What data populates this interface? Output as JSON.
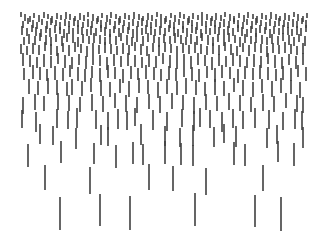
{
  "artwork": {
    "description": "Abstract pattern of vertical dashes, dense and short at top, sparse and long at bottom",
    "stroke_color": "#3f3f3f",
    "stroke_width": 1.6,
    "background": "#ffffff",
    "rows": [
      {
        "y": 14,
        "h": 6,
        "xs": [
          21,
          25,
          30,
          34,
          39,
          44,
          48,
          52,
          57,
          61,
          66,
          70,
          75,
          80,
          84,
          88,
          93,
          98,
          102,
          107,
          111,
          116,
          120,
          125,
          129,
          134,
          139,
          143,
          148,
          152,
          157,
          161,
          166,
          171,
          175,
          180,
          184,
          189,
          193,
          198,
          202,
          207,
          212,
          216,
          221,
          225,
          230,
          234,
          239,
          244,
          248,
          253,
          257,
          262,
          266,
          271,
          276,
          280,
          285,
          289,
          294,
          298,
          303,
          307
        ]
      },
      {
        "y": 20,
        "h": 7,
        "xs": [
          23,
          28,
          33,
          37,
          42,
          47,
          51,
          56,
          60,
          65,
          69,
          74,
          78,
          83,
          88,
          92,
          97,
          101,
          106,
          110,
          115,
          119,
          124,
          129,
          133,
          138,
          142,
          147,
          151,
          156,
          161,
          165,
          170,
          174,
          179,
          183,
          188,
          192,
          197,
          202,
          206,
          211,
          215,
          220,
          224,
          229,
          234,
          238,
          243,
          247,
          252,
          256,
          261,
          266,
          270,
          275,
          279,
          284,
          288,
          293,
          297,
          302,
          306
        ]
      },
      {
        "y": 27,
        "h": 8,
        "xs": [
          22,
          27,
          32,
          36,
          41,
          46,
          50,
          55,
          60,
          64,
          69,
          73,
          78,
          82,
          87,
          91,
          96,
          101,
          105,
          110,
          114,
          119,
          123,
          128,
          133,
          137,
          142,
          146,
          151,
          155,
          160,
          165,
          169,
          174,
          178,
          183,
          187,
          192,
          196,
          201,
          206,
          210,
          215,
          219,
          224,
          228,
          233,
          238,
          242,
          247,
          251,
          256,
          260,
          265,
          270,
          274,
          279,
          283,
          288,
          292,
          297,
          301,
          306
        ]
      },
      {
        "y": 35,
        "h": 9,
        "xs": [
          24,
          29,
          35,
          40,
          46,
          51,
          56,
          62,
          67,
          73,
          78,
          83,
          89,
          94,
          100,
          105,
          110,
          116,
          121,
          127,
          132,
          137,
          143,
          148,
          154,
          159,
          164,
          170,
          175,
          181,
          186,
          191,
          197,
          202,
          208,
          213,
          218,
          224,
          229,
          235,
          240,
          245,
          251,
          256,
          262,
          267,
          272,
          278,
          283,
          289,
          294,
          299,
          305
        ]
      },
      {
        "y": 44,
        "h": 10,
        "xs": [
          21,
          27,
          33,
          39,
          45,
          51,
          57,
          63,
          69,
          75,
          81,
          87,
          93,
          99,
          105,
          111,
          117,
          123,
          129,
          135,
          141,
          147,
          153,
          159,
          165,
          171,
          177,
          183,
          189,
          195,
          201,
          207,
          213,
          219,
          225,
          231,
          237,
          243,
          249,
          255,
          261,
          267,
          273,
          279,
          285,
          291,
          297,
          303
        ]
      },
      {
        "y": 55,
        "h": 12,
        "xs": [
          23,
          30,
          37,
          44,
          51,
          58,
          65,
          72,
          79,
          86,
          93,
          100,
          107,
          114,
          121,
          128,
          135,
          142,
          149,
          156,
          163,
          170,
          177,
          184,
          191,
          198,
          205,
          212,
          219,
          226,
          233,
          240,
          247,
          254,
          261,
          268,
          275,
          282,
          289,
          296,
          303
        ]
      },
      {
        "y": 67,
        "h": 13,
        "xs": [
          24,
          33,
          40,
          47,
          55,
          63,
          70,
          78,
          85,
          92,
          100,
          108,
          115,
          123,
          131,
          138,
          146,
          154,
          161,
          169,
          176,
          184,
          192,
          199,
          207,
          215,
          222,
          230,
          238,
          245,
          253,
          260,
          268,
          276,
          283,
          291,
          298,
          306
        ]
      },
      {
        "y": 80,
        "h": 15,
        "xs": [
          29,
          38,
          48,
          57,
          67,
          72,
          82,
          91,
          101,
          110,
          120,
          129,
          139,
          148,
          158,
          167,
          177,
          186,
          196,
          205,
          215,
          224,
          234,
          243,
          253,
          262,
          272,
          281,
          291,
          300
        ]
      },
      {
        "y": 95,
        "h": 16,
        "xs": [
          23,
          35,
          44,
          58,
          69,
          80,
          92,
          103,
          115,
          126,
          137,
          149,
          160,
          172,
          183,
          194,
          206,
          217,
          229,
          240,
          251,
          263,
          274,
          286,
          297,
          303
        ]
      },
      {
        "y": 110,
        "h": 19,
        "xs": [
          22,
          36,
          57,
          68,
          77,
          96,
          108,
          118,
          127,
          135,
          153,
          167,
          182,
          194,
          200,
          210,
          222,
          233,
          243,
          255,
          269,
          283,
          295,
          302
        ]
      },
      {
        "y": 126,
        "h": 20,
        "xs": [
          40,
          53,
          76,
          101,
          108,
          141,
          165,
          180,
          193,
          214,
          224,
          236,
          267,
          277,
          303
        ]
      },
      {
        "y": 143,
        "h": 22,
        "xs": [
          28,
          61,
          94,
          116,
          133,
          143,
          165,
          181,
          193,
          234,
          245,
          278,
          294
        ]
      },
      {
        "y": 166,
        "h": 26,
        "xs": [
          45,
          90,
          149,
          173,
          206,
          263
        ]
      },
      {
        "y": 195,
        "h": 33,
        "xs": [
          60,
          100,
          130,
          195,
          255,
          281
        ]
      }
    ]
  }
}
